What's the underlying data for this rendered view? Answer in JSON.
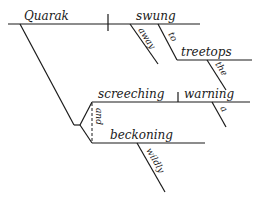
{
  "diagram": {
    "type": "sentence-diagram",
    "style": "Reed-Kellogg",
    "ink_color": "#1a1a1a",
    "background": "#ffffff",
    "main_clause": {
      "subject": "Quarak",
      "verb": "swung",
      "verb_modifiers": {
        "adverb": "away",
        "preposition": "to",
        "prepositional_object": "treetops",
        "object_modifier": "the"
      }
    },
    "compound_participles": {
      "conjunction": "and",
      "first": {
        "participle": "screeching",
        "object": "warning",
        "object_modifier": "a"
      },
      "second": {
        "participle": "beckoning",
        "modifier": "wildly"
      }
    }
  }
}
